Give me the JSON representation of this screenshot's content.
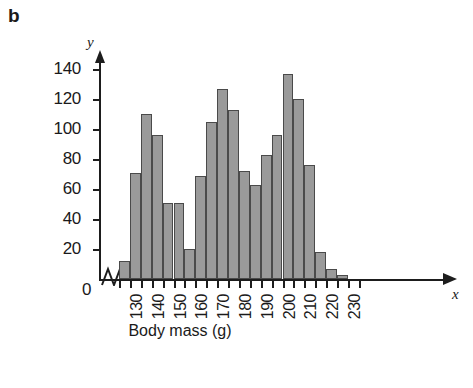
{
  "figure": {
    "panel_letter": "b",
    "x_axis_title": "Body mass (g)",
    "y_axis_title": "Number of individuals",
    "x_axis_symbol": "x",
    "y_axis_symbol": "y",
    "origin_label": "0",
    "bar_fill_color": "#9a9a9a",
    "bar_edge_color": "#4a4a4a",
    "axis_color": "#1d1d1d",
    "background_color": "#ffffff"
  },
  "chart_data": {
    "type": "bar",
    "title": "",
    "xlabel": "Body mass (g)",
    "ylabel": "Number of individuals",
    "grid": false,
    "legend": null,
    "xlim": [
      122.5,
      235
    ],
    "ylim": [
      0,
      150
    ],
    "ytick_labels": [
      "20",
      "40",
      "60",
      "80",
      "100",
      "120",
      "140"
    ],
    "ytick_values": [
      20,
      40,
      60,
      80,
      100,
      120,
      140
    ],
    "xtick_labels": [
      "130",
      "140",
      "150",
      "160",
      "170",
      "180",
      "190",
      "200",
      "210",
      "220",
      "230"
    ],
    "xtick_values": [
      130,
      140,
      150,
      160,
      170,
      180,
      190,
      200,
      210,
      220,
      230
    ],
    "xtick_minor_values": [
      125,
      135,
      145,
      155,
      165,
      175,
      185,
      195,
      205,
      215,
      225,
      235
    ],
    "bin_width": 5,
    "bins": [
      {
        "x0": 125,
        "x1": 130,
        "value": 12
      },
      {
        "x0": 130,
        "x1": 135,
        "value": 71
      },
      {
        "x0": 135,
        "x1": 140,
        "value": 110
      },
      {
        "x0": 140,
        "x1": 145,
        "value": 96
      },
      {
        "x0": 145,
        "x1": 150,
        "value": 51
      },
      {
        "x0": 150,
        "x1": 155,
        "value": 51
      },
      {
        "x0": 155,
        "x1": 160,
        "value": 20
      },
      {
        "x0": 160,
        "x1": 165,
        "value": 69
      },
      {
        "x0": 165,
        "x1": 170,
        "value": 105
      },
      {
        "x0": 170,
        "x1": 175,
        "value": 127
      },
      {
        "x0": 175,
        "x1": 180,
        "value": 113
      },
      {
        "x0": 180,
        "x1": 185,
        "value": 72
      },
      {
        "x0": 185,
        "x1": 190,
        "value": 63
      },
      {
        "x0": 190,
        "x1": 195,
        "value": 83
      },
      {
        "x0": 195,
        "x1": 200,
        "value": 96
      },
      {
        "x0": 200,
        "x1": 205,
        "value": 137
      },
      {
        "x0": 205,
        "x1": 210,
        "value": 120
      },
      {
        "x0": 210,
        "x1": 215,
        "value": 76
      },
      {
        "x0": 215,
        "x1": 220,
        "value": 18
      },
      {
        "x0": 220,
        "x1": 225,
        "value": 7
      },
      {
        "x0": 225,
        "x1": 230,
        "value": 3
      }
    ],
    "categories": [
      "125-130",
      "130-135",
      "135-140",
      "140-145",
      "145-150",
      "150-155",
      "155-160",
      "160-165",
      "165-170",
      "170-175",
      "175-180",
      "180-185",
      "185-190",
      "190-195",
      "195-200",
      "200-205",
      "205-210",
      "210-215",
      "215-220",
      "220-225",
      "225-230"
    ],
    "values": [
      12,
      71,
      110,
      96,
      51,
      51,
      20,
      69,
      105,
      127,
      113,
      72,
      63,
      83,
      96,
      137,
      120,
      76,
      18,
      7,
      3
    ]
  }
}
